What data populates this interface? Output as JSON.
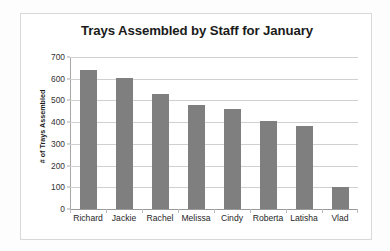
{
  "chart_data": {
    "type": "bar",
    "title": "Trays Assembled by Staff for January",
    "xlabel": "",
    "ylabel": "# of Trays Assembled",
    "categories": [
      "Richard",
      "Jackie",
      "Rachel",
      "Melissa",
      "Cindy",
      "Roberta",
      "Latisha",
      "Vlad"
    ],
    "values": [
      640,
      603,
      530,
      478,
      460,
      406,
      382,
      101
    ],
    "ylim": [
      0,
      700
    ],
    "ytick_step": 100,
    "yticks": [
      700,
      600,
      500,
      400,
      300,
      200,
      100,
      0
    ],
    "ytick_labels": [
      "700",
      "600",
      "500",
      "400",
      "300",
      "200",
      "100",
      "0"
    ],
    "grid": true,
    "grid_axis": "y",
    "legend": false,
    "legend_position": "none",
    "bar_color": "#7f7f7f",
    "plot_background": "#ffffff",
    "gridline_color": "#d0d0d0",
    "axis_color": "#a8a8a8",
    "title_color": "#1b1b1b",
    "frame_border_color": "#d8d8d8"
  }
}
